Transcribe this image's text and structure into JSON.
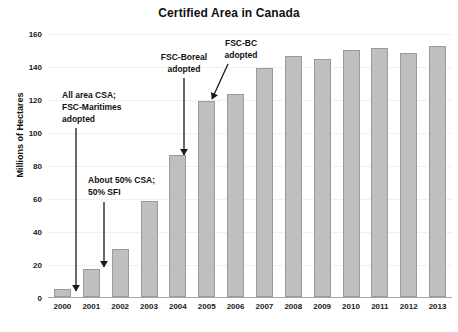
{
  "chart_data": {
    "type": "bar",
    "title": "Certified Area in Canada",
    "xlabel": "",
    "ylabel": "Millions of Hectares",
    "categories": [
      "2000",
      "2001",
      "2002",
      "2003",
      "2004",
      "2005",
      "2006",
      "2007",
      "2008",
      "2009",
      "2010",
      "2011",
      "2012",
      "2013"
    ],
    "values": [
      5,
      17,
      29,
      58,
      86,
      119,
      123,
      139,
      146,
      144,
      150,
      151,
      148,
      152
    ],
    "ylim": [
      0,
      160
    ],
    "ytick_step": 20,
    "yticks": [
      "0",
      "20",
      "40",
      "60",
      "80",
      "100",
      "120",
      "140",
      "160"
    ],
    "grid": true,
    "legend": "none",
    "bar_color": "#bfbfbf",
    "bar_border_color": "#9a9a9a",
    "annotations": [
      {
        "id": "ann-0",
        "text": "All area CSA;\nFSC-Maritimes\nadopted",
        "target_category": "2000",
        "arrow": {
          "x1": 76,
          "y1": 128,
          "x2": 76,
          "y2": 291
        }
      },
      {
        "id": "ann-1",
        "text": "About 50% CSA;\n50% SFI",
        "target_category": "2001",
        "arrow": {
          "x1": 104,
          "y1": 202,
          "x2": 104,
          "y2": 267
        }
      },
      {
        "id": "ann-2",
        "text": "FSC-Boreal\nadopted",
        "target_category": "2004",
        "arrow": {
          "x1": 184,
          "y1": 78,
          "x2": 184,
          "y2": 155
        }
      },
      {
        "id": "ann-3",
        "text": "FSC-BC\nadopted",
        "target_category": "2005",
        "arrow": {
          "x1": 228,
          "y1": 64,
          "x2": 212,
          "y2": 99
        }
      }
    ]
  }
}
